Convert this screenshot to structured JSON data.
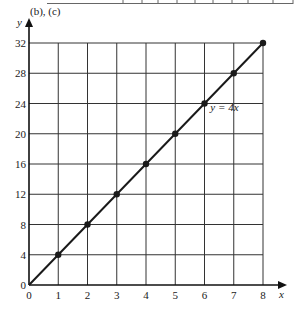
{
  "figure": {
    "part_label": "(b), (c)",
    "line_label": "y = 4x"
  },
  "chart_data": {
    "type": "line",
    "title": "(b), (c)",
    "xlabel": "x",
    "ylabel": "y",
    "x": [
      0,
      1,
      2,
      3,
      4,
      5,
      6,
      7,
      8
    ],
    "series": [
      {
        "name": "y = 4x",
        "values": [
          0,
          4,
          8,
          12,
          16,
          20,
          24,
          28,
          32
        ],
        "markers": true
      }
    ],
    "x_ticks": [
      0,
      1,
      2,
      3,
      4,
      5,
      6,
      7,
      8
    ],
    "y_ticks": [
      0,
      4,
      8,
      12,
      16,
      20,
      24,
      28,
      32
    ],
    "xlim": [
      0,
      8
    ],
    "ylim": [
      0,
      32
    ],
    "grid": true,
    "annotations": [
      {
        "text": "y = 4x",
        "x": 6.2,
        "y": 23
      }
    ],
    "legend": null
  },
  "colors": {
    "line": "#1a1a1a",
    "grid": "#333333",
    "background": "#ffffff"
  }
}
